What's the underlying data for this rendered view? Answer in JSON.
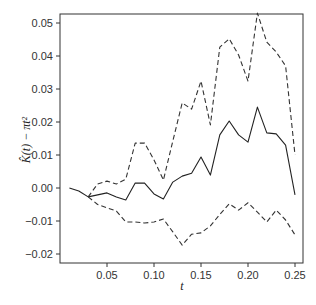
{
  "chart_data": {
    "type": "line",
    "title": "",
    "xlabel": "t",
    "ylabel": "K̂(t) − πt²",
    "xlim": [
      0.0,
      0.26
    ],
    "ylim": [
      -0.023,
      0.053
    ],
    "xticks": [
      0.05,
      0.1,
      0.15,
      0.2,
      0.25
    ],
    "xtick_labels": [
      "0.05",
      "0.10",
      "0.15",
      "0.20",
      "0.25"
    ],
    "yticks": [
      -0.02,
      -0.01,
      0.0,
      0.01,
      0.02,
      0.03,
      0.04,
      0.05
    ],
    "ytick_labels": [
      "−0.02",
      "−0.01",
      "0.00",
      "0.01",
      "0.02",
      "0.03",
      "0.04",
      "0.05"
    ],
    "grid": false,
    "legend": null,
    "series": [
      {
        "name": "estimate",
        "style": "solid",
        "color": "#222222",
        "x": [
          0.01,
          0.02,
          0.03,
          0.04,
          0.05,
          0.06,
          0.07,
          0.08,
          0.09,
          0.1,
          0.11,
          0.12,
          0.13,
          0.14,
          0.15,
          0.16,
          0.17,
          0.18,
          0.19,
          0.2,
          0.21,
          0.22,
          0.23,
          0.24,
          0.25
        ],
        "values": [
          0.0,
          -0.0009,
          -0.0027,
          -0.0021,
          -0.0015,
          -0.0027,
          -0.0036,
          0.0015,
          0.0015,
          -0.0018,
          -0.0033,
          0.0018,
          0.0036,
          0.0045,
          0.0094,
          0.0039,
          0.0161,
          0.0203,
          0.0161,
          0.0139,
          0.0245,
          0.0167,
          0.0164,
          0.013,
          -0.0021
        ]
      },
      {
        "name": "upper envelope",
        "style": "dashed",
        "color": "#333333",
        "x": [
          0.03,
          0.04,
          0.05,
          0.06,
          0.07,
          0.08,
          0.09,
          0.1,
          0.11,
          0.12,
          0.13,
          0.14,
          0.15,
          0.16,
          0.17,
          0.18,
          0.19,
          0.2,
          0.21,
          0.22,
          0.23,
          0.24,
          0.25
        ],
        "values": [
          -0.0027,
          0.0012,
          0.0021,
          0.0012,
          0.0027,
          0.0136,
          0.0136,
          0.0085,
          0.0024,
          0.0142,
          0.0258,
          0.0239,
          0.0324,
          0.0191,
          0.0427,
          0.0452,
          0.0403,
          0.0324,
          0.053,
          0.0442,
          0.0412,
          0.037,
          0.01
        ]
      },
      {
        "name": "lower envelope",
        "style": "dashed",
        "color": "#333333",
        "x": [
          0.03,
          0.04,
          0.05,
          0.06,
          0.07,
          0.08,
          0.09,
          0.1,
          0.11,
          0.12,
          0.13,
          0.14,
          0.15,
          0.16,
          0.17,
          0.18,
          0.19,
          0.2,
          0.21,
          0.22,
          0.23,
          0.24,
          0.25
        ],
        "values": [
          -0.0027,
          -0.005,
          -0.006,
          -0.007,
          -0.0103,
          -0.0103,
          -0.0106,
          -0.0103,
          -0.0094,
          -0.0133,
          -0.0173,
          -0.014,
          -0.0136,
          -0.0115,
          -0.008,
          -0.0048,
          -0.0067,
          -0.0045,
          -0.0073,
          -0.0103,
          -0.0067,
          -0.0097,
          -0.0142
        ]
      }
    ]
  }
}
